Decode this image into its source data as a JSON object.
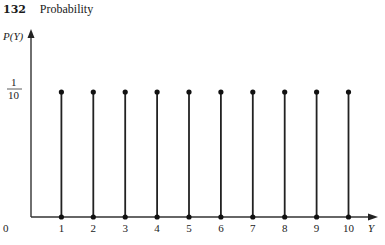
{
  "header": {
    "page_number": "132",
    "section_title": "Probability"
  },
  "chart_data": {
    "type": "bar",
    "subtype": "stem",
    "title": "",
    "xlabel": "Y",
    "ylabel": "P(Y)",
    "categories": [
      "1",
      "2",
      "3",
      "4",
      "5",
      "6",
      "7",
      "8",
      "9",
      "10"
    ],
    "x": [
      1,
      2,
      3,
      4,
      5,
      6,
      7,
      8,
      9,
      10
    ],
    "values": [
      0.1,
      0.1,
      0.1,
      0.1,
      0.1,
      0.1,
      0.1,
      0.1,
      0.1,
      0.1
    ],
    "ytick_labels": [
      "0",
      "1/10"
    ],
    "yticks": [
      0,
      0.1
    ],
    "xtick_labels": [
      "1",
      "2",
      "3",
      "4",
      "5",
      "6",
      "7",
      "8",
      "9",
      "10"
    ],
    "origin_label": "0",
    "grid": false,
    "legend": null,
    "ylim": [
      0,
      0.13
    ],
    "xlim": [
      0,
      10.9
    ]
  },
  "labels": {
    "ylabel": "P(Y)",
    "xlabel": "Y",
    "origin": "0",
    "ytick_num": "1",
    "ytick_den": "10"
  }
}
